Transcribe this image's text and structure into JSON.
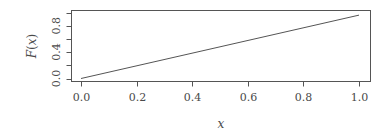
{
  "chart_data": {
    "type": "line",
    "title": "",
    "xlabel": "x",
    "ylabel": "F(x)",
    "xlim": [
      0.0,
      1.0
    ],
    "ylim": [
      0.0,
      1.0
    ],
    "grid": false,
    "legend": null,
    "x_ticks": [
      "0.0",
      "0.2",
      "0.4",
      "0.6",
      "0.8",
      "1.0"
    ],
    "y_ticks": [
      0.0,
      0.2,
      0.4,
      0.6,
      0.8,
      1.0
    ],
    "y_tick_labels": [
      "0.0",
      "0.4",
      "0.8"
    ],
    "series": [
      {
        "name": "F(x)",
        "x": [
          0.0,
          1.0
        ],
        "y": [
          0.0,
          0.96
        ]
      }
    ]
  },
  "labels": {
    "xlabel": "x",
    "ylabel_main": "F",
    "ylabel_paren_open": "(",
    "ylabel_var": "x",
    "ylabel_paren_close": ")"
  },
  "colors": {
    "line": "#555555",
    "text": "#4a4a4a"
  }
}
